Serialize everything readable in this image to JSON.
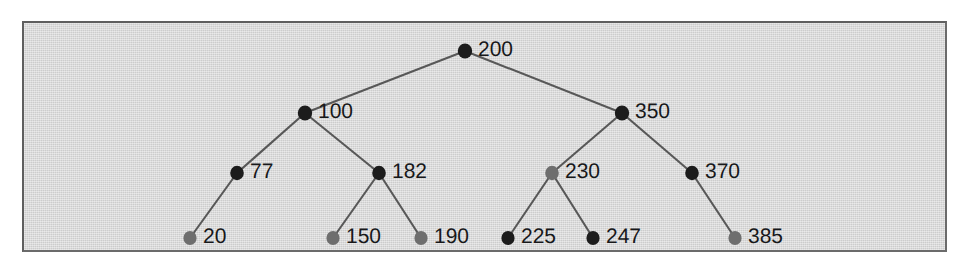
{
  "figure": {
    "type": "binary-search-tree",
    "panel": {
      "background_color": "#d6d6d6",
      "border_color": "#5f5f5f",
      "x": 22,
      "y": 21,
      "width": 925,
      "height": 231
    },
    "page_background_color": "#ffffff",
    "edge_color": "#585858",
    "label_color": "#17181a",
    "node_colors": {
      "dark": "#1c1c1c",
      "gray": "#6e6e6e"
    }
  },
  "nodes": [
    {
      "id": "n200",
      "label": "200",
      "value": 200,
      "x": 465,
      "y": 51,
      "fill": "dark",
      "depth": 0,
      "rx": 7.2,
      "ry": 7.6
    },
    {
      "id": "n100",
      "label": "100",
      "value": 100,
      "x": 305,
      "y": 113,
      "fill": "dark",
      "depth": 1,
      "rx": 7.2,
      "ry": 7.6
    },
    {
      "id": "n350",
      "label": "350",
      "value": 350,
      "x": 622,
      "y": 113,
      "fill": "dark",
      "depth": 1,
      "rx": 7.2,
      "ry": 7.6
    },
    {
      "id": "n77",
      "label": "77",
      "value": 77,
      "x": 237,
      "y": 173,
      "fill": "dark",
      "depth": 2,
      "rx": 6.8,
      "ry": 7.2
    },
    {
      "id": "n182",
      "label": "182",
      "value": 182,
      "x": 379,
      "y": 173,
      "fill": "dark",
      "depth": 2,
      "rx": 6.8,
      "ry": 7.2
    },
    {
      "id": "n230",
      "label": "230",
      "value": 230,
      "x": 552,
      "y": 173,
      "fill": "gray",
      "depth": 2,
      "rx": 6.8,
      "ry": 7.2
    },
    {
      "id": "n370",
      "label": "370",
      "value": 370,
      "x": 692,
      "y": 173,
      "fill": "dark",
      "depth": 2,
      "rx": 6.8,
      "ry": 7.2
    },
    {
      "id": "n20",
      "label": "20",
      "value": 20,
      "x": 190,
      "y": 238,
      "fill": "gray",
      "depth": 3,
      "rx": 6.6,
      "ry": 7.0
    },
    {
      "id": "n150",
      "label": "150",
      "value": 150,
      "x": 333,
      "y": 238,
      "fill": "gray",
      "depth": 3,
      "rx": 6.6,
      "ry": 7.0
    },
    {
      "id": "n190",
      "label": "190",
      "value": 190,
      "x": 421,
      "y": 238,
      "fill": "gray",
      "depth": 3,
      "rx": 6.6,
      "ry": 7.0
    },
    {
      "id": "n225",
      "label": "225",
      "value": 225,
      "x": 508,
      "y": 238,
      "fill": "dark",
      "depth": 3,
      "rx": 6.6,
      "ry": 7.0
    },
    {
      "id": "n247",
      "label": "247",
      "value": 247,
      "x": 593,
      "y": 238,
      "fill": "dark",
      "depth": 3,
      "rx": 6.6,
      "ry": 7.0
    },
    {
      "id": "n385",
      "label": "385",
      "value": 385,
      "x": 735,
      "y": 238,
      "fill": "gray",
      "depth": 3,
      "rx": 6.6,
      "ry": 7.0
    }
  ],
  "edges": [
    {
      "from": "n200",
      "to": "n100",
      "side": "left"
    },
    {
      "from": "n200",
      "to": "n350",
      "side": "right"
    },
    {
      "from": "n100",
      "to": "n77",
      "side": "left"
    },
    {
      "from": "n100",
      "to": "n182",
      "side": "right"
    },
    {
      "from": "n350",
      "to": "n230",
      "side": "left"
    },
    {
      "from": "n350",
      "to": "n370",
      "side": "right"
    },
    {
      "from": "n77",
      "to": "n20",
      "side": "left"
    },
    {
      "from": "n182",
      "to": "n150",
      "side": "left"
    },
    {
      "from": "n182",
      "to": "n190",
      "side": "right"
    },
    {
      "from": "n230",
      "to": "n225",
      "side": "left"
    },
    {
      "from": "n230",
      "to": "n247",
      "side": "right"
    },
    {
      "from": "n370",
      "to": "n385",
      "side": "right"
    }
  ],
  "label_offset": {
    "dx": 13,
    "dy": -1
  }
}
